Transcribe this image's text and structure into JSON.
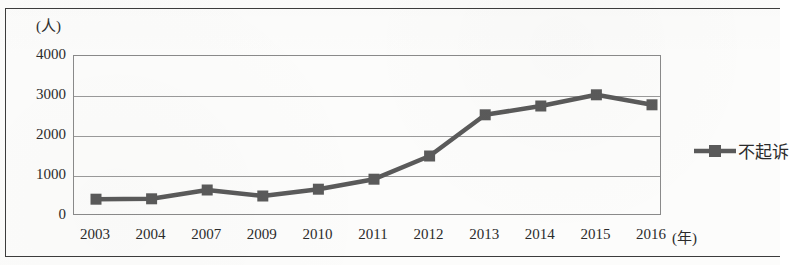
{
  "chart_data": {
    "type": "line",
    "title": "",
    "subtitle": "",
    "xlabel": "(年)",
    "ylabel": "(人)",
    "x": [
      "2003",
      "2004",
      "2007",
      "2009",
      "2010",
      "2011",
      "2012",
      "2013",
      "2014",
      "2015",
      "2016"
    ],
    "categories": [
      "2003",
      "2004",
      "2007",
      "2009",
      "2010",
      "2011",
      "2012",
      "2013",
      "2014",
      "2015",
      "2016"
    ],
    "series": [
      {
        "name": "不起诉",
        "values": [
          420,
          430,
          650,
          500,
          670,
          920,
          1500,
          2530,
          2750,
          3030,
          2780
        ],
        "color": "#5a5a5a",
        "marker": "square"
      }
    ],
    "ylim": [
      0,
      4000
    ],
    "ytick_labels": [
      "0",
      "1000",
      "2000",
      "3000",
      "4000"
    ],
    "ytick_values": [
      0,
      1000,
      2000,
      3000,
      4000
    ],
    "xtick_labels": [
      "2003",
      "2004",
      "2007",
      "2009",
      "2010",
      "2011",
      "2012",
      "2013",
      "2014",
      "2015",
      "2016"
    ],
    "grid": true,
    "grid_axis": "y",
    "legend_position": "right",
    "legend_entries": [
      "不起诉"
    ]
  },
  "axes": {
    "y_unit": "(人)",
    "x_unit": "(年)"
  },
  "legend": {
    "items": [
      {
        "label": "不起诉",
        "color": "#5a5a5a"
      }
    ]
  },
  "colors": {
    "series": "#5a5a5a",
    "gridline": "#9a9a9a",
    "frame": "#3c3c3c",
    "text": "#2b2b2b",
    "background": "#fcfcfb"
  }
}
